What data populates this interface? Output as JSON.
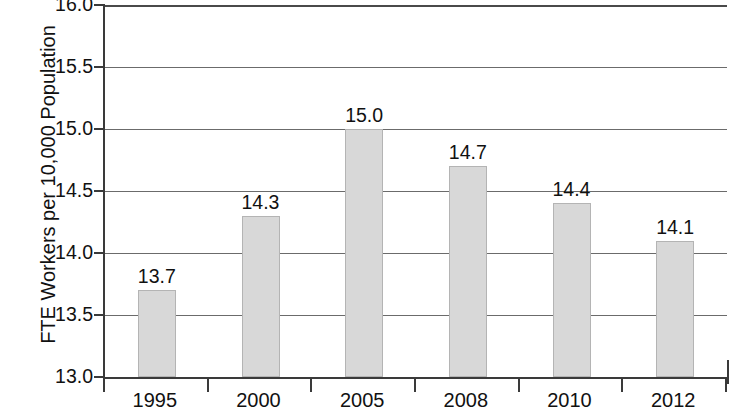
{
  "chart_data": {
    "type": "bar",
    "title": "",
    "subtitle": "",
    "xlabel": "",
    "ylabel": "FTE Workers per 10,000 Population",
    "categories": [
      "1995",
      "2000",
      "2005",
      "2008",
      "2010",
      "2012"
    ],
    "values": [
      13.7,
      14.3,
      15.0,
      14.7,
      14.4,
      14.1
    ],
    "data_labels": [
      "13.7",
      "14.3",
      "15.0",
      "14.7",
      "14.4",
      "14.1"
    ],
    "ylim": [
      13.0,
      16.0
    ],
    "y_ticks": [
      13.0,
      13.5,
      14.0,
      14.5,
      15.0,
      15.5,
      16.0
    ],
    "y_tick_labels": [
      "13.0",
      "13.5",
      "14.0",
      "14.5",
      "15.0",
      "15.5",
      "16.0"
    ],
    "grid": true,
    "grid_axis": "y",
    "legend": false,
    "legend_position": "none",
    "bar_color": "#d8d8d8",
    "bar_border_color": "#b4b4b4",
    "axis_color": "#3a3a3a",
    "gridline_color": "#6b6b6b",
    "text_color": "#111111",
    "background_color": "#ffffff"
  }
}
